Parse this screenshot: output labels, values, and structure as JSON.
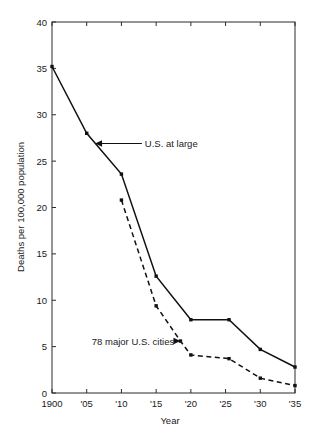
{
  "chart_data": {
    "type": "line",
    "title": "",
    "xlabel": "Year",
    "ylabel": "Deaths per 100,000 population",
    "xlim": [
      1900,
      1935
    ],
    "ylim": [
      0,
      40
    ],
    "grid": false,
    "legend_position": "inline-annotations",
    "x_tick_labels": [
      "1900",
      "'05",
      "'10",
      "'15",
      "'20",
      "'25",
      "'30",
      "'35"
    ],
    "x_tick_values": [
      1900,
      1905,
      1910,
      1915,
      1920,
      1925,
      1930,
      1935
    ],
    "y_tick_labels": [
      "0",
      "5",
      "10",
      "15",
      "20",
      "25",
      "30",
      "35",
      "40"
    ],
    "y_tick_values": [
      0,
      5,
      10,
      15,
      20,
      25,
      30,
      35,
      40
    ],
    "series": [
      {
        "name": "U.S. at large",
        "style": "solid",
        "x": [
          1900,
          1905,
          1910,
          1915,
          1920,
          1925.5,
          1930,
          1935
        ],
        "values": [
          35.2,
          28.0,
          23.6,
          12.6,
          7.9,
          7.9,
          4.7,
          2.8
        ]
      },
      {
        "name": "78 major U.S. cities",
        "style": "dashed",
        "x": [
          1910,
          1915,
          1918.5,
          1920,
          1925.5,
          1930,
          1935
        ],
        "values": [
          20.8,
          9.4,
          5.6,
          4.1,
          3.7,
          1.6,
          0.8
        ]
      }
    ],
    "annotations": [
      {
        "label": "U.S. at large",
        "target_x": 1906.2,
        "target_y": 26.9,
        "text_x": 1909.2,
        "text_y": 26.9,
        "arrow": "left"
      },
      {
        "label": "78 major U.S. cities",
        "target_x": 1918.5,
        "target_y": 5.6,
        "text_x": 1917.6,
        "text_y": 5.6,
        "arrow": "right"
      }
    ]
  }
}
